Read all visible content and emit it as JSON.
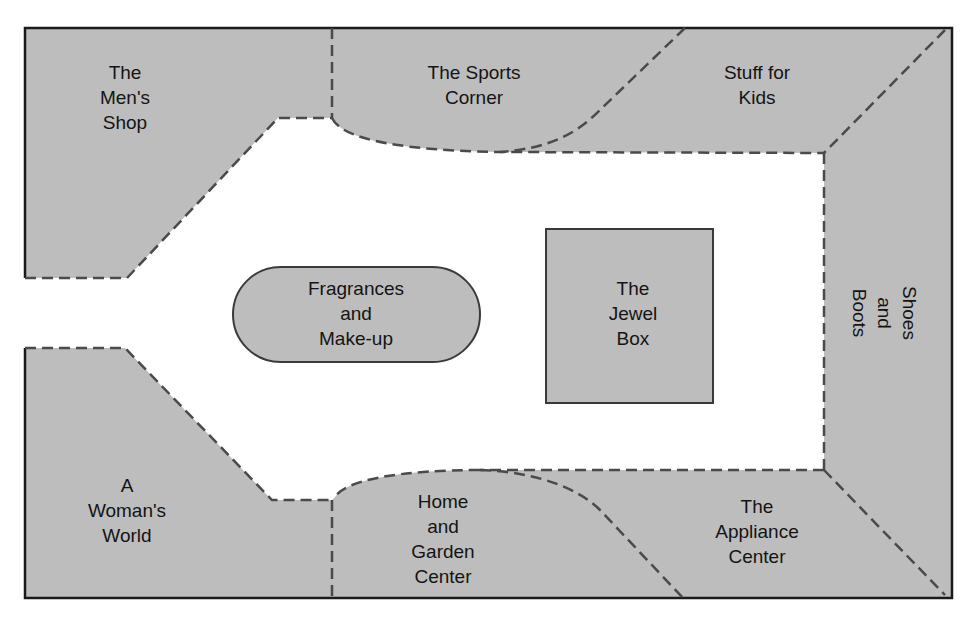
{
  "diagram": {
    "type": "store floor plan",
    "colors": {
      "department_fill": "#bdbdbd",
      "aisle_fill": "#ffffff",
      "wall_stroke": "#1a1a1a",
      "divider_stroke": "#4a4a4a"
    },
    "departments": [
      {
        "id": "mens-shop",
        "label": "The\nMen's\nShop"
      },
      {
        "id": "sports-corner",
        "label": "The Sports\nCorner"
      },
      {
        "id": "stuff-for-kids",
        "label": "Stuff for\nKids"
      },
      {
        "id": "shoes-and-boots",
        "label": "Shoes\nand\nBoots"
      },
      {
        "id": "womans-world",
        "label": "A\nWoman's\nWorld"
      },
      {
        "id": "home-and-garden",
        "label": "Home\nand\nGarden\nCenter"
      },
      {
        "id": "appliance-center",
        "label": "The\nAppliance\nCenter"
      },
      {
        "id": "fragrances",
        "label": "Fragrances\nand\nMake-up"
      },
      {
        "id": "jewel-box",
        "label": "The\nJewel\nBox"
      }
    ]
  }
}
